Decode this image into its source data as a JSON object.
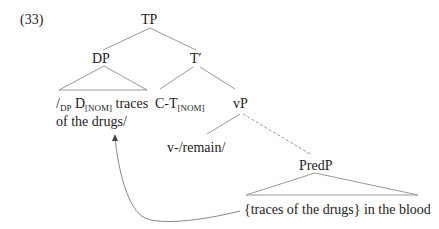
{
  "example_number": "(33)",
  "nodes": {
    "tp": "TP",
    "dp": "DP",
    "t_bar": "T′",
    "vp": "vP",
    "predp": "PredP",
    "v_head": "v-/remain/"
  },
  "dp_content": {
    "slash_open": "/",
    "dp_sub": "DP",
    "d": "D",
    "d_sub": "[NOM]",
    "line1_rest": "traces",
    "line2": "of the drugs/"
  },
  "ct_content": {
    "ct": "C-T",
    "ct_sub": "[NOM]"
  },
  "predp_content": "{traces of the drugs}  in the blood",
  "colors": {
    "line": "#888888",
    "text": "#222222"
  }
}
